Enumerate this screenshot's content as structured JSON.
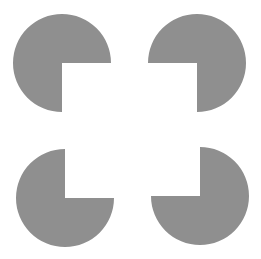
{
  "figure": {
    "title": "",
    "fill_color": "#8f8f8f",
    "background": "#ffffff",
    "shapes": [
      {
        "name": "top-left",
        "cx": 62,
        "cy": 63,
        "r": 49,
        "notch": "bottom-right"
      },
      {
        "name": "top-right",
        "cx": 197,
        "cy": 63,
        "r": 49,
        "notch": "bottom-left"
      },
      {
        "name": "bottom-left",
        "cx": 65,
        "cy": 198,
        "r": 49,
        "notch": "top-right"
      },
      {
        "name": "bottom-right",
        "cx": 200,
        "cy": 196,
        "r": 49,
        "notch": "top-left"
      }
    ]
  }
}
